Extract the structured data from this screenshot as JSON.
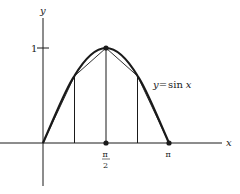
{
  "diagram": {
    "axes": {
      "x_label": "x",
      "y_label": "y",
      "y_tick_label": "1",
      "x_tick_labels": {
        "half_pi_numerator": "π",
        "half_pi_denominator": "2",
        "pi": "π"
      }
    },
    "curve_label": "y = sin x",
    "curve_label_parts": {
      "lhs": "y",
      "eq": "=",
      "fn": "sin",
      "arg": "x"
    },
    "partition_points": [
      "0",
      "π/4",
      "π/2",
      "3π/4",
      "π"
    ],
    "marked_points": [
      "(0, 0)",
      "(π/2, 1)",
      "(π, 0)"
    ],
    "colors": {
      "stroke": "#1a1a1a",
      "background": "#ffffff"
    }
  }
}
